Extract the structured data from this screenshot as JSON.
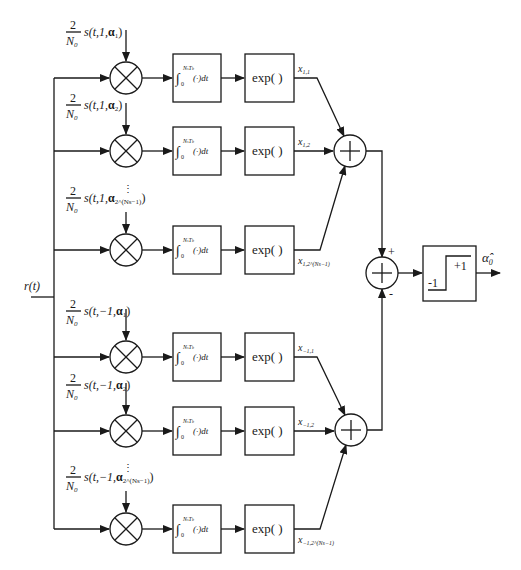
{
  "diagram": {
    "type": "block-diagram",
    "input": {
      "label": "r(t)"
    },
    "colors": {
      "line": "#1a1a1a",
      "background": "#ffffff"
    },
    "branches": [
      {
        "id": "b1",
        "y": 78,
        "group": "plus",
        "ref_frac_num": "2",
        "ref_frac_den": "N",
        "ref_frac_den_sub": "0",
        "ref_text": "s(t,1,",
        "ref_alpha": "α",
        "ref_alpha_sub": "1",
        "ref_close": ")",
        "integrator": {
          "upper": "N",
          "upper_sub": "s",
          "upper2": "T",
          "upper2_sub": "b",
          "lower": "0",
          "body": "(·)dt"
        },
        "exp_label": "exp( )",
        "out_label": "x",
        "out_sub": "1,1",
        "ellipsis_above": false
      },
      {
        "id": "b2",
        "y": 151,
        "group": "plus",
        "ref_frac_num": "2",
        "ref_frac_den": "N",
        "ref_frac_den_sub": "0",
        "ref_text": "s(t,1,",
        "ref_alpha": "α",
        "ref_alpha_sub": "2",
        "ref_close": ")",
        "integrator": {
          "upper": "N",
          "upper_sub": "s",
          "upper2": "T",
          "upper2_sub": "b",
          "lower": "0",
          "body": "(·)dt"
        },
        "exp_label": "exp( )",
        "out_label": "x",
        "out_sub": "1,2",
        "ellipsis_above": false
      },
      {
        "id": "b3",
        "y": 250,
        "group": "plus",
        "ref_frac_num": "2",
        "ref_frac_den": "N",
        "ref_frac_den_sub": "0",
        "ref_text": "s(t,1,",
        "ref_alpha": "α",
        "ref_alpha_sub": "2^(Ns−1)",
        "ref_close": ")",
        "integrator": {
          "upper": "N",
          "upper_sub": "s",
          "upper2": "T",
          "upper2_sub": "b",
          "lower": "0",
          "body": "(·)dt"
        },
        "exp_label": "exp( )",
        "out_label": "x",
        "out_sub": "1,2^(Ns−1)",
        "ellipsis_above": true
      },
      {
        "id": "b4",
        "y": 357,
        "group": "minus",
        "ref_frac_num": "2",
        "ref_frac_den": "N",
        "ref_frac_den_sub": "0",
        "ref_text": "s(t,−1,",
        "ref_alpha": "α",
        "ref_alpha_sub": "1",
        "ref_close": ")",
        "integrator": {
          "upper": "N",
          "upper_sub": "s",
          "upper2": "T",
          "upper2_sub": "b",
          "lower": "0",
          "body": "(·)dt"
        },
        "exp_label": "exp( )",
        "out_label": "x",
        "out_sub": "−1,1",
        "ellipsis_above": false
      },
      {
        "id": "b5",
        "y": 431,
        "group": "minus",
        "ref_frac_num": "2",
        "ref_frac_den": "N",
        "ref_frac_den_sub": "0",
        "ref_text": "s(t,−1,",
        "ref_alpha": "α",
        "ref_alpha_sub": "2",
        "ref_close": ")",
        "integrator": {
          "upper": "N",
          "upper_sub": "s",
          "upper2": "T",
          "upper2_sub": "b",
          "lower": "0",
          "body": "(·)dt"
        },
        "exp_label": "exp( )",
        "out_label": "x",
        "out_sub": "−1,2",
        "ellipsis_above": false
      },
      {
        "id": "b6",
        "y": 529,
        "group": "minus",
        "ref_frac_num": "2",
        "ref_frac_den": "N",
        "ref_frac_den_sub": "0",
        "ref_text": "s(t,−1,",
        "ref_alpha": "α",
        "ref_alpha_sub": "2^(Ns−1)",
        "ref_close": ")",
        "integrator": {
          "upper": "N",
          "upper_sub": "s",
          "upper2": "T",
          "upper2_sub": "b",
          "lower": "0",
          "body": "(·)dt"
        },
        "exp_label": "exp( )",
        "out_label": "x",
        "out_sub": "−1,2^(Ns−1)",
        "ellipsis_above": true
      }
    ],
    "adders": {
      "upper": {
        "symbol": "+"
      },
      "lower": {
        "symbol": "+"
      },
      "final": {
        "symbol": "+",
        "plus_sign": "+",
        "minus_sign": "-"
      }
    },
    "decision": {
      "low_label": "-1",
      "high_label": "+1"
    },
    "output": {
      "label": "α̂",
      "label_sub": "0"
    }
  }
}
